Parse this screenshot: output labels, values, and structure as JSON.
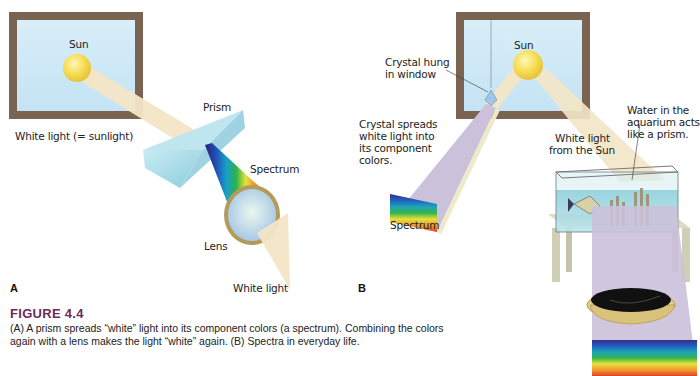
{
  "figure": {
    "number_label": "FIGURE 4.4",
    "caption_line1": "(A) A prism spreads “white” light into its component colors (a spectrum). Combining the colors",
    "caption_line2": "again with a lens makes the light “white” again. (B) Spectra in everyday life.",
    "accent_color": "#6a2a5e"
  },
  "panel_a": {
    "letter": "A",
    "labels": {
      "sun": "Sun",
      "white_light_sunlight": "White light (= sunlight)",
      "prism": "Prism",
      "spectrum": "Spectrum",
      "lens": "Lens",
      "white_light": "White light"
    }
  },
  "panel_b": {
    "letter": "B",
    "labels": {
      "sun": "Sun",
      "crystal_hung_1": "Crystal hung",
      "crystal_hung_2": "in window",
      "crystal_spreads_1": "Crystal spreads",
      "crystal_spreads_2": "white light into",
      "crystal_spreads_3": "its component",
      "crystal_spreads_4": "colors.",
      "spectrum": "Spectrum",
      "white_light_sun_1": "White light",
      "white_light_sun_2": "from the Sun",
      "water_1": "Water in the",
      "water_2": "aquarium acts",
      "water_3": "like a prism."
    }
  },
  "colors": {
    "window_frame": "#7a6350",
    "sky": "#cfe8f6",
    "sun": "#f2d94a",
    "light_beam": "#f3e6c6",
    "prism": "#a9d9e6",
    "spectrum_top": "#c9bed8"
  }
}
